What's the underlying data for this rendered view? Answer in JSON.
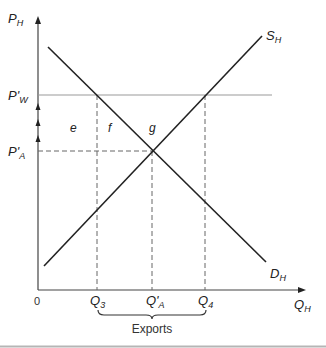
{
  "diagram": {
    "axes": {
      "y_label": "P",
      "y_label_sub": "H",
      "x_label": "Q",
      "x_label_sub": "H",
      "origin": "0"
    },
    "price_levels": [
      {
        "label": "P'",
        "sub": "W",
        "name": "world-price"
      },
      {
        "label": "P'",
        "sub": "A",
        "name": "autarky-price"
      }
    ],
    "quantity_levels": [
      {
        "label": "Q",
        "sub": "3"
      },
      {
        "label": "Q'",
        "sub": "A"
      },
      {
        "label": "Q",
        "sub": "4"
      }
    ],
    "curves": {
      "supply": {
        "label": "S",
        "sub": "H"
      },
      "demand": {
        "label": "D",
        "sub": "H"
      }
    },
    "areas": {
      "e": "e",
      "f": "f",
      "g": "g"
    },
    "brace_label": "Exports",
    "colors": {
      "curve": "#222222",
      "world_price_line": "#9a9a9a",
      "dashed": "#666666",
      "bottom_rule": "#b5b5b5"
    }
  }
}
